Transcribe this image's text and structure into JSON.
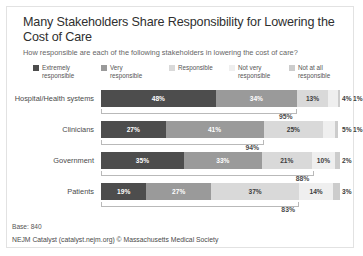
{
  "card": {
    "title": "Many Stakeholders Share Responsibility for Lowering the Cost of Care",
    "subtitle": "How responsible are each of the following stakeholders in lowering the cost of care?",
    "base_note": "Base: 840",
    "source": "NEJM Catalyst (catalyst.nejm.org) © Massachusetts Medical Society"
  },
  "chart_data": {
    "type": "bar",
    "subtype": "stacked-horizontal-100",
    "title": "Many Stakeholders Share Responsibility for Lowering the Cost of Care",
    "subtitle": "How responsible are each of the following stakeholders in lowering the cost of care?",
    "xlabel": "",
    "ylabel": "",
    "xlim": [
      0,
      100
    ],
    "grid": false,
    "legend_position": "top",
    "categories": [
      "Hospital/Health systems",
      "Clinicians",
      "Government",
      "Patients"
    ],
    "series": [
      {
        "name": "Extremely responsible",
        "color": "#4d4d4d",
        "values": [
          48,
          27,
          35,
          19
        ]
      },
      {
        "name": "Very responsible",
        "color": "#9a9a9a",
        "values": [
          34,
          41,
          33,
          27
        ]
      },
      {
        "name": "Responsible",
        "color": "#d9d9d9",
        "values": [
          13,
          25,
          21,
          37
        ]
      },
      {
        "name": "Not very responsible",
        "color": "#efefef",
        "values": [
          4,
          5,
          10,
          14
        ]
      },
      {
        "name": "Not at all responsible",
        "color": "#cccccc",
        "values": [
          1,
          1,
          2,
          3
        ]
      }
    ],
    "labels": [
      [
        "48%",
        "34%",
        "13%",
        "4%",
        "1%"
      ],
      [
        "27%",
        "41%",
        "25%",
        "5%",
        "1%"
      ],
      [
        "35%",
        "33%",
        "21%",
        "10%",
        "2%"
      ],
      [
        "19%",
        "27%",
        "37%",
        "14%",
        "3%"
      ]
    ],
    "top_box_annotations": [
      {
        "category": "Hospital/Health systems",
        "value": "95%",
        "spans_series": 2,
        "span_total": 82
      },
      {
        "category": "Clinicians",
        "value": "94%",
        "spans_series": 2,
        "span_total": 68
      },
      {
        "category": "Government",
        "value": "88%",
        "spans_series": 3,
        "span_total": 89
      },
      {
        "category": "Patients",
        "value": "83%",
        "spans_series": 3,
        "span_total": 83
      }
    ]
  },
  "legend": {
    "items": [
      {
        "label": "Extremely\nresponsible",
        "color": "#4d4d4d",
        "x": 0,
        "w": 58
      },
      {
        "label": "Very\nresponsible",
        "color": "#9a9a9a",
        "x": 68,
        "w": 58
      },
      {
        "label": "Responsible",
        "color": "#d9d9d9",
        "x": 136,
        "w": 58
      },
      {
        "label": "Not very\nresponsible",
        "color": "#efefef",
        "x": 196,
        "w": 58
      },
      {
        "label": "Not at all\nresponsible",
        "color": "#cccccc",
        "x": 256,
        "w": 58
      }
    ]
  }
}
